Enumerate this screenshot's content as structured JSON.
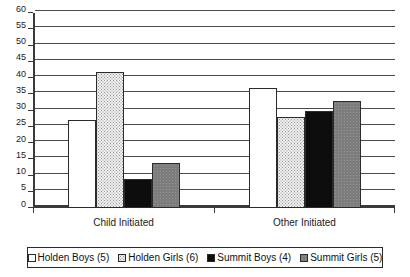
{
  "chart_data": {
    "type": "bar",
    "title": "",
    "subtitle": "",
    "xlabel": "",
    "ylabel": "",
    "categories": [
      "Child Initiated",
      "Other Initiated"
    ],
    "series": [
      {
        "name": "Holden Boys (5)",
        "fill": "white",
        "values": [
          27,
          37
        ]
      },
      {
        "name": "Holden Girls (6)",
        "fill": "stipple",
        "values": [
          42,
          28
        ]
      },
      {
        "name": "Summit Boys (4)",
        "fill": "black",
        "values": [
          9,
          30
        ]
      },
      {
        "name": "Summit Girls (5)",
        "fill": "gray",
        "values": [
          14,
          33
        ]
      }
    ],
    "ylim": [
      0,
      60
    ],
    "ytick_step": 5,
    "yticks": [
      0,
      5,
      10,
      15,
      20,
      25,
      30,
      35,
      40,
      45,
      50,
      55,
      60
    ],
    "ytick_labels": [
      "0",
      "5",
      "10",
      "15",
      "20",
      "25",
      "30",
      "35",
      "40",
      "45",
      "50",
      "55",
      "60"
    ],
    "grid": true,
    "grid_axis": "y",
    "legend_position": "bottom",
    "colors": {
      "axis": "#3a3a3a",
      "gridline": "#4a4a4a",
      "bar_outline": "#2b2b2b",
      "fill_white": "#ffffff",
      "fill_stipple": "#eeeeee",
      "fill_black": "#0d0d0d",
      "fill_gray": "#7d7d7d",
      "text": "#1a1a1a",
      "background": "#ffffff"
    }
  }
}
